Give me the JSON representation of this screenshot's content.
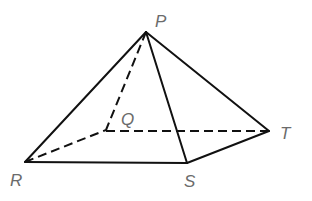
{
  "diagram": {
    "type": "pyramid",
    "colors": {
      "line": "#111111",
      "label": "#6b6b6b",
      "background": "#ffffff"
    },
    "vertices": {
      "P": {
        "label": "P",
        "x": 146,
        "y": 32
      },
      "Q": {
        "label": "Q",
        "x": 106,
        "y": 130
      },
      "R": {
        "label": "R",
        "x": 25,
        "y": 162
      },
      "S": {
        "label": "S",
        "x": 187,
        "y": 163
      },
      "T": {
        "label": "T",
        "x": 269,
        "y": 131
      }
    },
    "edges": {
      "solid": [
        "PR",
        "PS",
        "PT",
        "RS",
        "ST"
      ],
      "hidden": [
        "PQ",
        "RQ",
        "QT"
      ]
    },
    "labels": {
      "P": "P",
      "Q": "Q",
      "R": "R",
      "S": "S",
      "T": "T"
    }
  }
}
